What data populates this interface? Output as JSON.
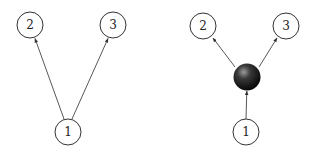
{
  "diagrams": [
    {
      "name": "direct-graph",
      "nodes": [
        {
          "id": "1",
          "label": "1",
          "x": 68,
          "y": 132,
          "r": 13,
          "type": "circle"
        },
        {
          "id": "2",
          "label": "2",
          "x": 30,
          "y": 25,
          "r": 13,
          "type": "circle"
        },
        {
          "id": "3",
          "label": "3",
          "x": 113,
          "y": 25,
          "r": 13,
          "type": "circle"
        }
      ],
      "edges": [
        {
          "from": "1",
          "to": "2"
        },
        {
          "from": "1",
          "to": "3"
        }
      ]
    },
    {
      "name": "hub-graph",
      "nodes": [
        {
          "id": "1",
          "label": "1",
          "x": 246,
          "y": 132,
          "r": 13,
          "type": "circle"
        },
        {
          "id": "2",
          "label": "2",
          "x": 203,
          "y": 26,
          "r": 13,
          "type": "circle"
        },
        {
          "id": "3",
          "label": "3",
          "x": 286,
          "y": 26,
          "r": 13,
          "type": "circle"
        },
        {
          "id": "hub",
          "label": "",
          "x": 247,
          "y": 77,
          "r": 13,
          "type": "filled-sphere"
        }
      ],
      "edges": [
        {
          "from": "1",
          "to": "hub"
        },
        {
          "from": "hub",
          "to": "2"
        },
        {
          "from": "hub",
          "to": "3"
        }
      ]
    }
  ],
  "colors": {
    "stroke": "#333333",
    "sphere_light": "#8a8a8a",
    "sphere_dark": "#0a0a0a"
  }
}
